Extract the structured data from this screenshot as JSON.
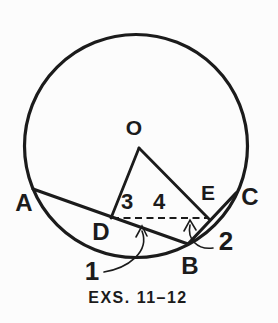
{
  "figure": {
    "caption": "EXS. 11–12",
    "points": {
      "O": "O",
      "A": "A",
      "B": "B",
      "C": "C",
      "D": "D",
      "E": "E"
    },
    "angles": {
      "a1": "1",
      "a2": "2",
      "a3": "3",
      "a4": "4"
    },
    "colors": {
      "ink": "#1b1b1b",
      "background": "#fcfcfc"
    }
  }
}
